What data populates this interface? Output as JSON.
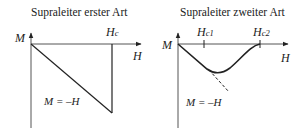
{
  "diagrams": [
    {
      "title": "Supraleiter erster Art",
      "y_axis_label": "M",
      "x_axis_label": "H",
      "critical_field_label": {
        "main": "H",
        "sub": "c"
      },
      "relation_label": "M = –H"
    },
    {
      "title": "Supraleiter zweiter Art",
      "y_axis_label": "M",
      "x_axis_label": "H",
      "critical_field_1_label": {
        "main": "H",
        "sub": "c1"
      },
      "critical_field_2_label": {
        "main": "H",
        "sub": "c2"
      },
      "relation_label": "M = –H"
    }
  ],
  "colors": {
    "line": "#222222",
    "background": "#ffffff"
  }
}
